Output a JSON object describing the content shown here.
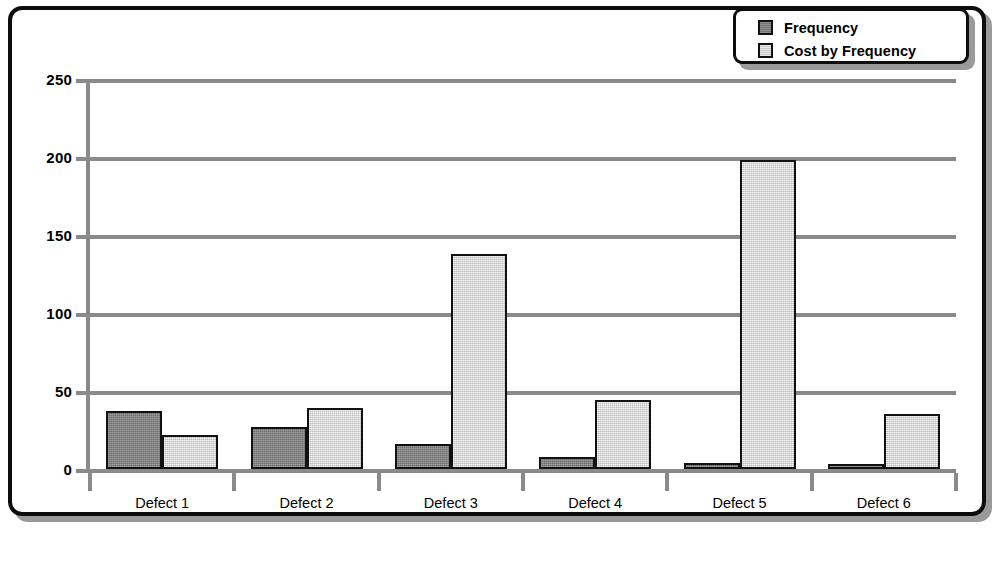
{
  "chart_data": {
    "type": "bar",
    "title": "",
    "subtitle": "",
    "xlabel": "",
    "ylabel": "",
    "categories": [
      "Defect 1",
      "Defect 2",
      "Defect 3",
      "Defect 4",
      "Defect 5",
      "Defect 6"
    ],
    "series": [
      {
        "name": "Frequency",
        "color": "#7f7f7f",
        "values": [
          37,
          27,
          16,
          8,
          4,
          3
        ]
      },
      {
        "name": "Cost by Frequency",
        "color": "#d6d6d6",
        "values": [
          22,
          39,
          138,
          44,
          198,
          35
        ]
      }
    ],
    "ylim": [
      0,
      250
    ],
    "yticks": [
      0,
      50,
      100,
      150,
      200,
      250
    ],
    "ytick_labels": [
      "0",
      "50",
      "100",
      "150",
      "200",
      "250"
    ],
    "grid": true,
    "grid_axis": "y",
    "legend_position": "top-right",
    "legend_entries": [
      "Frequency",
      "Cost by Frequency"
    ]
  },
  "legend": {
    "items": [
      {
        "label": "Frequency",
        "swatch": "legend-swatch-frequency"
      },
      {
        "label": "Cost by Frequency",
        "swatch": "legend-swatch-cost-by-frequency"
      }
    ]
  },
  "axes": {
    "y_tick_labels": [
      "250",
      "200",
      "150",
      "100",
      "50",
      "0"
    ],
    "x_tick_labels": [
      "Defect 1",
      "Defect 2",
      "Defect 3",
      "Defect 4",
      "Defect 5",
      "Defect 6"
    ]
  },
  "colors": {
    "series_frequency": "#7f7f7f",
    "series_cost_by_frequency": "#d6d6d6",
    "grid": "#8a8a8a",
    "frame": "#0d0d0d",
    "shadow": "#9a9a9a",
    "background": "#ffffff"
  }
}
